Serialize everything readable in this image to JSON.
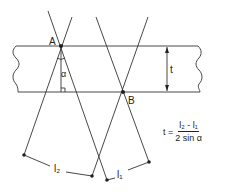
{
  "diagram": {
    "labels": {
      "point_a": "A",
      "point_b": "B",
      "thickness": "t",
      "angle": "α",
      "l2": "l₂",
      "l1": "l₁"
    },
    "formula": {
      "lhs": "t =",
      "numerator": "l₂ - l₁",
      "denominator": "2 sin α"
    },
    "colors": {
      "line": "#333333",
      "background": "#ffffff"
    }
  }
}
